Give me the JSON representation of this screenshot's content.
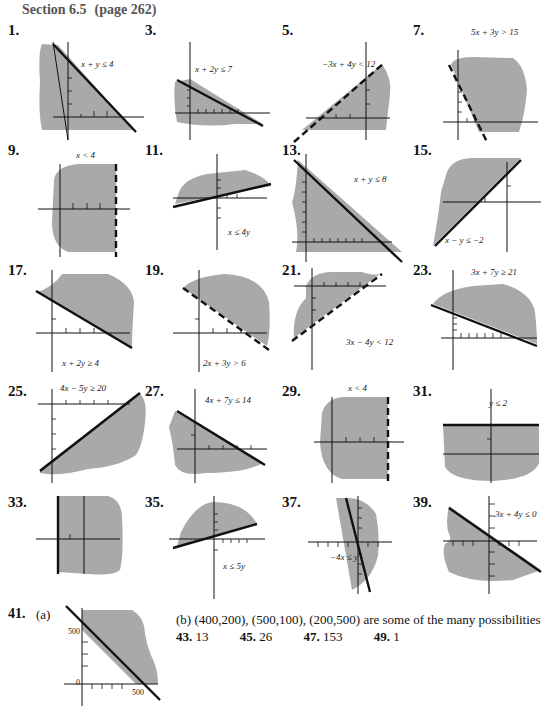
{
  "header": {
    "section": "Section 6.5",
    "page": "(page 262)"
  },
  "problems": [
    {
      "num": "1.",
      "inequality": "x + y ≤ 4"
    },
    {
      "num": "3.",
      "inequality": "x + 2y ≤ 7"
    },
    {
      "num": "5.",
      "inequality": "−3x + 4y < 12"
    },
    {
      "num": "7.",
      "inequality": "5x + 3y > 15"
    },
    {
      "num": "9.",
      "inequality": "x < 4"
    },
    {
      "num": "11.",
      "inequality": "x ≤ 4y"
    },
    {
      "num": "13.",
      "inequality": "x + y ≤ 8"
    },
    {
      "num": "15.",
      "inequality": "x − y ≤ −2"
    },
    {
      "num": "17.",
      "inequality": "x + 2y ≥ 4"
    },
    {
      "num": "19.",
      "inequality": "2x + 3y > 6"
    },
    {
      "num": "21.",
      "inequality": "3x − 4y < 12"
    },
    {
      "num": "23.",
      "inequality": "3x + 7y ≥ 21"
    },
    {
      "num": "25.",
      "inequality": "4x − 5y ≥ 20"
    },
    {
      "num": "27.",
      "inequality": "4x + 7y ≤ 14"
    },
    {
      "num": "29.",
      "inequality": "x < 4"
    },
    {
      "num": "31.",
      "inequality": "y ≤ 2"
    },
    {
      "num": "33.",
      "inequality": ""
    },
    {
      "num": "35.",
      "inequality": "x ≤ 5y"
    },
    {
      "num": "37.",
      "inequality": "−4x ≤ y"
    },
    {
      "num": "39.",
      "inequality": "3x + 4y ≤ 0"
    }
  ],
  "problem41": {
    "num": "41.",
    "part_a": "(a)",
    "y_label": "500",
    "x_label": "500",
    "origin_label": "0",
    "part_b": "(b) (400,200), (500,100), (200,500) are some of the many possibilities"
  },
  "short_answers": [
    {
      "num": "43.",
      "value": "13"
    },
    {
      "num": "45.",
      "value": "26"
    },
    {
      "num": "47.",
      "value": "153"
    },
    {
      "num": "49.",
      "value": "1"
    }
  ]
}
